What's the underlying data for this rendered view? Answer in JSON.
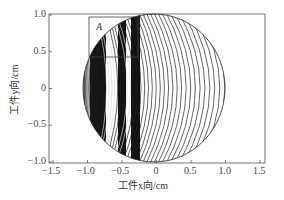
{
  "chart_data": {
    "type": "contour",
    "title": "",
    "xlabel": "工件x向/cm",
    "ylabel": "工件y向/cm",
    "xlim": [
      -1.5,
      1.5
    ],
    "ylim": [
      -1.0,
      1.0
    ],
    "x_ticks": [
      -1.5,
      -1.0,
      -0.5,
      0,
      0.5,
      1.0,
      1.5
    ],
    "x_tick_labels": [
      "-1.5",
      "-1.0",
      "-0.5",
      "0",
      "0.5",
      "1.0",
      "1.5"
    ],
    "y_ticks": [
      -1.0,
      -0.5,
      0,
      0.5,
      1.0
    ],
    "y_tick_labels": [
      "-1.0",
      "-0.5",
      "0",
      "0.5",
      "1.0"
    ],
    "grid": false,
    "legend": null,
    "domain_shape": "circle",
    "domain_center": [
      0,
      0
    ],
    "domain_radius": 1.0,
    "contour_description": "Concentric arc-shaped contour lines within circular workpiece; dense dark bands on left side (x ≈ -1.0 to -0.1) and sparser arcs toward right edge",
    "annotations": [
      {
        "label": "A",
        "type": "rectangle",
        "x_range": [
          -1.25,
          -0.18
        ],
        "y_range": [
          0.42,
          1.0
        ]
      }
    ]
  },
  "labels": {
    "xlabel": "工件x向/cm",
    "ylabel": "工件y向/cm",
    "region": "A"
  },
  "ticks": {
    "x": [
      "-1.5",
      "-1.0",
      "-0.5",
      "0",
      "0.5",
      "1.0",
      "1.5"
    ],
    "y": [
      "1.0",
      "0.5",
      "0",
      "-0.5",
      "-1.0"
    ]
  }
}
